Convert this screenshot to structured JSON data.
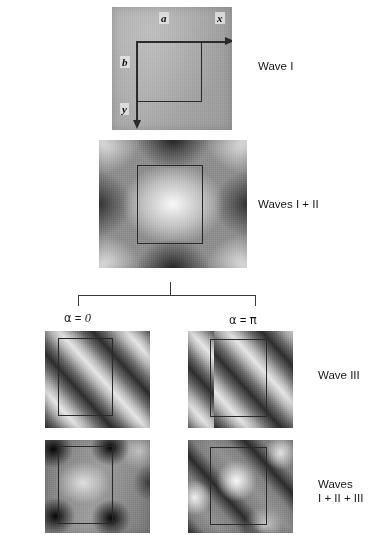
{
  "figure": {
    "axes": {
      "x_label": "x",
      "y_label": "y",
      "a_label": "a",
      "b_label": "b"
    },
    "bracket": {
      "left_branch_label": "α = 0",
      "right_branch_label": "α = π",
      "alpha_symbol": "α",
      "zero_value": "0",
      "pi_value": "π",
      "equals": "="
    },
    "row_labels": {
      "wave_i": "Wave I",
      "waves_i_ii": "Waves I + II",
      "wave_iii": "Wave III",
      "waves_all_line1": "Waves",
      "waves_all_line2": "I + II + III"
    },
    "panels": [
      {
        "id": "p1",
        "name": "wave-i-panel",
        "caption": "Wave I",
        "pattern": "uniform-gray"
      },
      {
        "id": "p2",
        "name": "waves-i-ii-panel",
        "caption": "Waves I + II",
        "pattern": "two-dimensional-standing-wave"
      },
      {
        "id": "p3",
        "name": "wave-iii-alpha-0-panel",
        "caption": "Wave III",
        "pattern": "diagonal-plane-wave",
        "alpha": "0"
      },
      {
        "id": "p4",
        "name": "wave-iii-alpha-pi-panel",
        "caption": "Wave III",
        "pattern": "diagonal-plane-wave",
        "alpha": "π"
      },
      {
        "id": "p5",
        "name": "waves-all-alpha-0-panel",
        "caption": "Waves I + II + III",
        "pattern": "dark-lobes-at-cell-corners",
        "alpha": "0"
      },
      {
        "id": "p6",
        "name": "waves-all-alpha-pi-panel",
        "caption": "Waves I + II + III",
        "pattern": "bright-diagonal-lobes",
        "alpha": "π"
      }
    ],
    "colors": {
      "ink": "#1a1a1a",
      "cell_outline": "#2a2a2a",
      "bracket": "#3a3a3a",
      "panel_mid_gray": "#9a9a9a"
    }
  }
}
